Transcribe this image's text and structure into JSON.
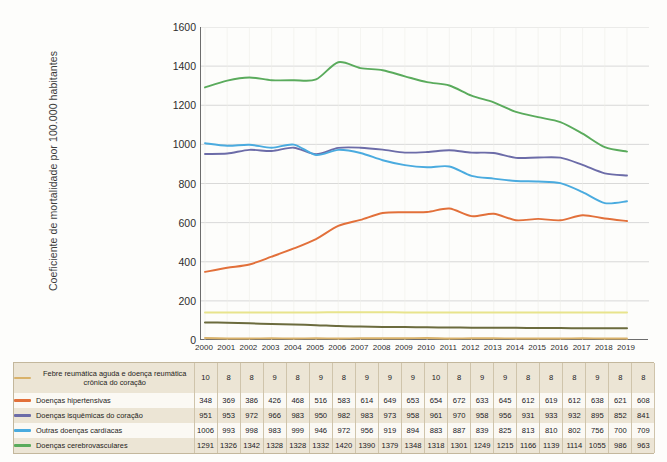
{
  "chart_data": {
    "type": "line",
    "title": "",
    "xlabel": "",
    "ylabel": "Coeficiente de mortalidade por 100.000 habitantes",
    "ylim": [
      0,
      1600
    ],
    "ytick_step": 200,
    "grid": true,
    "legend_position": "bottom-table",
    "categories": [
      "2000",
      "2001",
      "2002",
      "2003",
      "2004",
      "2005",
      "2006",
      "2007",
      "2008",
      "2009",
      "2010",
      "2011",
      "2012",
      "2013",
      "2014",
      "2015",
      "2016",
      "2017",
      "2018",
      "2019"
    ],
    "yticks": [
      "1600",
      "1400",
      "1200",
      "1000",
      "800",
      "600",
      "400",
      "200",
      "0"
    ],
    "series": [
      {
        "name": "Febre reumática aguda e doença reumática crônica do coração",
        "color": "#d9b26a",
        "values": [
          10,
          8,
          8,
          9,
          8,
          9,
          8,
          9,
          9,
          9,
          10,
          8,
          9,
          9,
          8,
          8,
          8,
          9,
          8,
          8
        ]
      },
      {
        "name": "Doenças hipertensivas",
        "color": "#e2703a",
        "values": [
          348,
          369,
          386,
          426,
          468,
          516,
          583,
          614,
          649,
          653,
          654,
          672,
          633,
          645,
          612,
          619,
          612,
          638,
          621,
          608
        ]
      },
      {
        "name": "Doenças isquêmicas do coração",
        "color": "#6c6ca8",
        "values": [
          951,
          953,
          972,
          966,
          983,
          950,
          982,
          983,
          973,
          958,
          961,
          970,
          958,
          956,
          931,
          933,
          932,
          895,
          852,
          841
        ]
      },
      {
        "name": "Outras doenças cardíacas",
        "color": "#4aabdf",
        "values": [
          1006,
          993,
          998,
          983,
          999,
          946,
          972,
          956,
          919,
          894,
          883,
          887,
          839,
          825,
          813,
          810,
          802,
          756,
          700,
          709
        ]
      },
      {
        "name": "Doenças cerebrovasculares",
        "color": "#5aab5c",
        "values": [
          1291,
          1326,
          1342,
          1328,
          1328,
          1332,
          1420,
          1390,
          1379,
          1348,
          1318,
          1301,
          1249,
          1215,
          1166,
          1139,
          1114,
          1055,
          986,
          963
        ]
      },
      {
        "name": "",
        "color": "#e8e48c",
        "values": [
          140,
          140,
          140,
          141,
          141,
          141,
          142,
          142,
          142,
          141,
          141,
          141,
          141,
          141,
          141,
          141,
          141,
          141,
          141,
          141
        ]
      },
      {
        "name": "",
        "color": "#6b6b3d",
        "values": [
          90,
          88,
          85,
          82,
          79,
          76,
          71,
          69,
          67,
          66,
          65,
          64,
          63,
          62,
          62,
          61,
          61,
          60,
          60,
          60
        ]
      }
    ]
  },
  "table": {
    "year_header": [
      "2000",
      "2001",
      "2002",
      "2003",
      "2004",
      "2005",
      "2006",
      "2007",
      "2008",
      "2009",
      "2010",
      "2011",
      "2012",
      "2013",
      "2014",
      "2015",
      "2016",
      "2017",
      "2018",
      "2019"
    ],
    "rows": [
      {
        "label": "Febre reumática aguda e doença reumática crônica do coração",
        "color": "#d9b26a",
        "values": [
          "10",
          "8",
          "8",
          "9",
          "8",
          "9",
          "8",
          "9",
          "9",
          "9",
          "10",
          "8",
          "9",
          "9",
          "8",
          "8",
          "8",
          "9",
          "8",
          "8"
        ]
      },
      {
        "label": "Doenças hipertensivas",
        "color": "#e2703a",
        "values": [
          "348",
          "369",
          "386",
          "426",
          "468",
          "516",
          "583",
          "614",
          "649",
          "653",
          "654",
          "672",
          "633",
          "645",
          "612",
          "619",
          "612",
          "638",
          "621",
          "608"
        ]
      },
      {
        "label": "Doenças isquêmicas do coração",
        "color": "#6c6ca8",
        "values": [
          "951",
          "953",
          "972",
          "966",
          "983",
          "950",
          "982",
          "983",
          "973",
          "958",
          "961",
          "970",
          "958",
          "956",
          "931",
          "933",
          "932",
          "895",
          "852",
          "841"
        ]
      },
      {
        "label": "Outras doenças cardíacas",
        "color": "#4aabdf",
        "values": [
          "1006",
          "993",
          "998",
          "983",
          "999",
          "946",
          "972",
          "956",
          "919",
          "894",
          "883",
          "887",
          "839",
          "825",
          "813",
          "810",
          "802",
          "756",
          "700",
          "709"
        ]
      },
      {
        "label": "Doenças cerebrovasculares",
        "color": "#5aab5c",
        "values": [
          "1291",
          "1326",
          "1342",
          "1328",
          "1328",
          "1332",
          "1420",
          "1390",
          "1379",
          "1348",
          "1318",
          "1301",
          "1249",
          "1215",
          "1166",
          "1139",
          "1114",
          "1055",
          "986",
          "963"
        ]
      }
    ]
  }
}
